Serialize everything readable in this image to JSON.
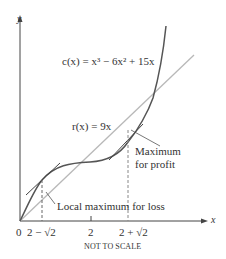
{
  "figure": {
    "axes": {
      "x_label": "x",
      "y_label": "y"
    },
    "curves": [
      {
        "name": "cost",
        "label": "c(x) = x³ − 6x² + 15x",
        "color": "#555555"
      },
      {
        "name": "revenue",
        "label": "r(x) = 9x",
        "color": "#b0b0b0"
      }
    ],
    "annotations": {
      "max_profit_line1": "Maximum",
      "max_profit_line2": "for profit",
      "local_max_loss": "Local maximum for loss"
    },
    "ticks": {
      "zero": "0",
      "t1": "2 − √2",
      "t2": "2",
      "t3": "2 + √2"
    },
    "footer": "NOT TO SCALE"
  }
}
